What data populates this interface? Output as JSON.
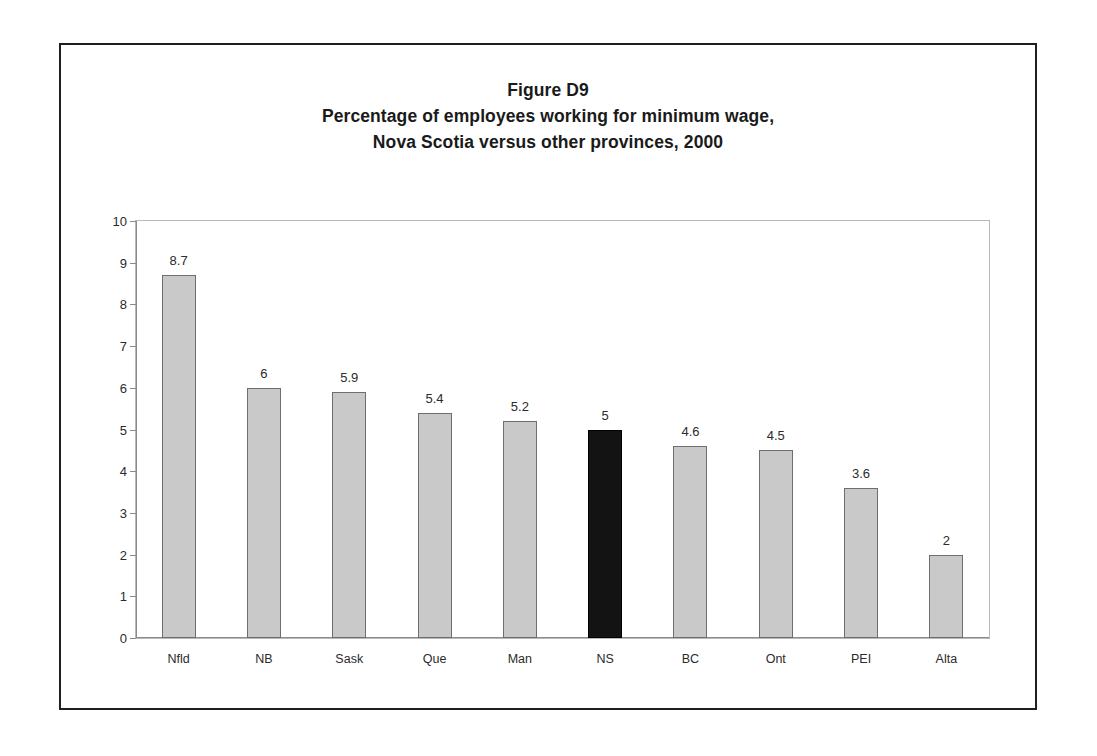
{
  "figure": {
    "title_lines": [
      "Figure D9",
      "Percentage of employees working for minimum wage,",
      "Nova Scotia versus other provinces, 2000"
    ],
    "frame_color": "#1f1f1f"
  },
  "colors": {
    "bar_fill": "#c9c9c9",
    "bar_border": "#6e6e6e",
    "highlight_fill": "#131313",
    "highlight_border": "#000000",
    "axis": "#8a8a8a",
    "plot_border": "#b9b9b9",
    "text": "#2b2b2b"
  },
  "chart_data": {
    "type": "bar",
    "title": "Figure D9 — Percentage of employees working for minimum wage, Nova Scotia versus other provinces, 2000",
    "subtitle": "Nova Scotia versus other provinces, 2000",
    "xlabel": "",
    "ylabel": "",
    "ylim": [
      0,
      10
    ],
    "ytick_step": 1,
    "yticks": [
      "10",
      "9",
      "8",
      "7",
      "6",
      "5",
      "4",
      "3",
      "2",
      "1",
      "0"
    ],
    "grid": false,
    "legend": false,
    "highlight_category": "NS",
    "categories": [
      "Nfld",
      "NB",
      "Sask",
      "Que",
      "Man",
      "NS",
      "BC",
      "Ont",
      "PEI",
      "Alta"
    ],
    "values": [
      8.7,
      6,
      5.9,
      5.4,
      5.2,
      5,
      4.6,
      4.5,
      3.6,
      2
    ],
    "value_labels": [
      "8.7",
      "6",
      "5.9",
      "5.4",
      "5.2",
      "5",
      "4.6",
      "4.5",
      "3.6",
      "2"
    ]
  }
}
